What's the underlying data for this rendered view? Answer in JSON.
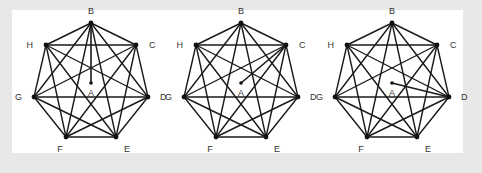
{
  "figure": {
    "colors": {
      "background": "#e8e8e8",
      "panel": "#ffffff",
      "line": "#1a1a1a",
      "text": "#333333"
    },
    "outer_vertices": [
      "B",
      "C",
      "D",
      "E",
      "F",
      "G",
      "H"
    ],
    "center_vertex": "A",
    "edge_mode": "complete",
    "panels": [
      {
        "name": "panel-1",
        "center_connects_to": "B"
      },
      {
        "name": "panel-2",
        "center_connects_to": "C"
      },
      {
        "name": "panel-3",
        "center_connects_to": "D"
      }
    ]
  }
}
